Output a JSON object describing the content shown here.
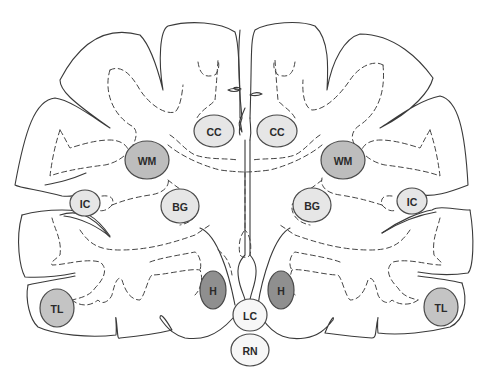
{
  "diagram": {
    "colors": {
      "light": "#e6e6e6",
      "medium": "#bdbdbd",
      "dark": "#8f8f8f",
      "outline": "#3a3a3a"
    },
    "nodes": [
      {
        "id": "cc-left",
        "label": "CC",
        "cx": 214,
        "cy": 131,
        "rx": 20,
        "ry": 16,
        "shade": "light"
      },
      {
        "id": "cc-right",
        "label": "CC",
        "cx": 277,
        "cy": 131,
        "rx": 20,
        "ry": 16,
        "shade": "light"
      },
      {
        "id": "wm-left",
        "label": "WM",
        "cx": 147,
        "cy": 160,
        "rx": 22,
        "ry": 19,
        "shade": "medium"
      },
      {
        "id": "wm-right",
        "label": "WM",
        "cx": 343,
        "cy": 160,
        "rx": 22,
        "ry": 19,
        "shade": "medium"
      },
      {
        "id": "ic-left",
        "label": "IC",
        "cx": 85,
        "cy": 203,
        "rx": 15,
        "ry": 13,
        "shade": "light"
      },
      {
        "id": "ic-right",
        "label": "IC",
        "cx": 412,
        "cy": 201,
        "rx": 15,
        "ry": 13,
        "shade": "light"
      },
      {
        "id": "bg-left",
        "label": "BG",
        "cx": 180,
        "cy": 205,
        "rx": 19,
        "ry": 17,
        "shade": "light"
      },
      {
        "id": "bg-right",
        "label": "BG",
        "cx": 312,
        "cy": 205,
        "rx": 19,
        "ry": 17,
        "shade": "light"
      },
      {
        "id": "h-left",
        "label": "H",
        "cx": 213,
        "cy": 290,
        "rx": 13,
        "ry": 19,
        "shade": "dark"
      },
      {
        "id": "h-right",
        "label": "H",
        "cx": 280,
        "cy": 290,
        "rx": 13,
        "ry": 19,
        "shade": "dark"
      },
      {
        "id": "lc",
        "label": "LC",
        "cx": 250,
        "cy": 315,
        "rx": 17,
        "ry": 16,
        "shade": "white"
      },
      {
        "id": "rn",
        "label": "RN",
        "cx": 250,
        "cy": 350,
        "rx": 19,
        "ry": 16,
        "shade": "white"
      },
      {
        "id": "tl-left",
        "label": "TL",
        "cx": 57,
        "cy": 308,
        "rx": 17,
        "ry": 19,
        "shade": "medium"
      },
      {
        "id": "tl-right",
        "label": "TL",
        "cx": 441,
        "cy": 307,
        "rx": 17,
        "ry": 19,
        "shade": "medium"
      }
    ],
    "labels": {
      "cc_left": "CC",
      "cc_right": "CC",
      "wm_left": "WM",
      "wm_right": "WM",
      "ic_left": "IC",
      "ic_right": "IC",
      "bg_left": "BG",
      "bg_right": "BG",
      "h_left": "H",
      "h_right": "H",
      "lc": "LC",
      "rn": "RN",
      "tl_left": "TL",
      "tl_right": "TL"
    }
  }
}
